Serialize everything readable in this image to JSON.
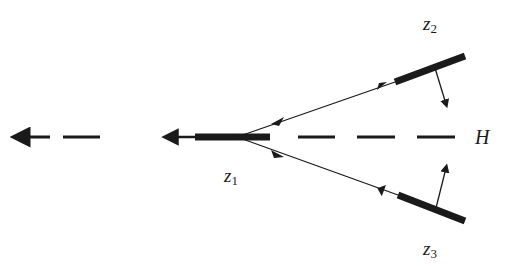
{
  "diagram": {
    "type": "feynman-diagram",
    "colors": {
      "ink": "#1a1a1a",
      "background": "#ffffff"
    },
    "labels": {
      "z1": {
        "base": "z",
        "sub": "1"
      },
      "z2": {
        "base": "z",
        "sub": "2"
      },
      "z3": {
        "base": "z",
        "sub": "3"
      },
      "H": "H"
    },
    "elements": [
      {
        "id": "scalar-line-left",
        "style": "dashed",
        "arrow": "left"
      },
      {
        "id": "thick-segment-z1",
        "style": "thick"
      },
      {
        "id": "fermion-upper",
        "style": "thin",
        "arrows": [
          "outward",
          "inward"
        ]
      },
      {
        "id": "fermion-lower",
        "style": "thin",
        "arrows": [
          "outward",
          "inward"
        ]
      },
      {
        "id": "thick-segment-z2",
        "style": "thick",
        "normal_arrow": "down"
      },
      {
        "id": "thick-segment-z3",
        "style": "thick",
        "normal_arrow": "up"
      },
      {
        "id": "scalar-line-H",
        "style": "dashed"
      }
    ]
  }
}
